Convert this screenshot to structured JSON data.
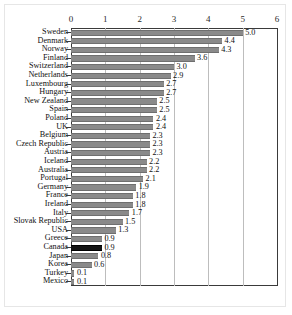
{
  "chart_data": {
    "type": "bar",
    "orientation": "horizontal",
    "title": "",
    "subtitle": "",
    "xlabel": "",
    "ylabel": "",
    "xlim": [
      0,
      6
    ],
    "xticks": [
      "0",
      "1",
      "2",
      "3",
      "4",
      "5",
      "6"
    ],
    "grid": true,
    "legend": null,
    "highlight_category": "Canada",
    "colors": {
      "bar": "#8a8a8a",
      "bar_highlight": "#141414",
      "gridline": "#bdbdbd",
      "axis": "#3a3a3a",
      "text": "#111111",
      "background": "#ffffff"
    },
    "categories": [
      "Sweden",
      "Denmark",
      "Norway",
      "Finland",
      "Switzerland",
      "Netherlands",
      "Luxembourg",
      "Hungary",
      "New Zealand",
      "Spain",
      "Poland",
      "UK",
      "Belgium",
      "Czech Republic",
      "Austria",
      "Iceland",
      "Australia",
      "Portugal",
      "Germany",
      "France",
      "Ireland",
      "Italy",
      "Slovak Republic",
      "USA",
      "Greece",
      "Canada",
      "Japan",
      "Korea",
      "Turkey",
      "Mexico"
    ],
    "values": [
      5.0,
      4.4,
      4.3,
      3.6,
      3.0,
      2.9,
      2.7,
      2.7,
      2.5,
      2.5,
      2.4,
      2.4,
      2.3,
      2.3,
      2.3,
      2.2,
      2.2,
      2.1,
      1.9,
      1.8,
      1.8,
      1.7,
      1.5,
      1.3,
      0.9,
      0.9,
      0.8,
      0.6,
      0.1,
      0.1
    ],
    "value_labels": [
      "5.0",
      "4.4",
      "4.3",
      "3.6",
      "3.0",
      "2.9",
      "2.7",
      "2.7",
      "2.5",
      "2.5",
      "2.4",
      "2.4",
      "2.3",
      "2.3",
      "2.3",
      "2.2",
      "2.2",
      "2.1",
      "1.9",
      "1.8",
      "1.8",
      "1.7",
      "1.5",
      "1.3",
      "0.9",
      "0.9",
      "0.8",
      "0.6",
      "0.1",
      "0.1"
    ]
  }
}
